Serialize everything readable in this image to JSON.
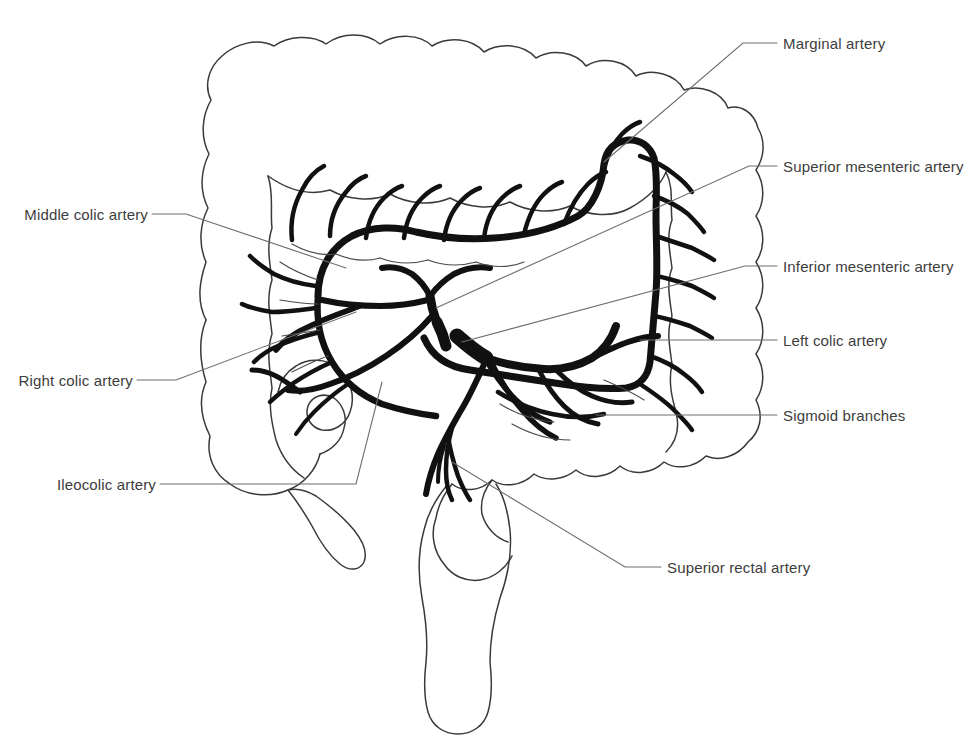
{
  "figure": {
    "background_color": "#ffffff",
    "outline_color": "#3a3a3a",
    "artery_color": "#111111",
    "leader_color": "#6e6e6e",
    "text_color": "#3d3d3d"
  },
  "labels": {
    "marginal_artery": "Marginal artery",
    "superior_mesenteric_artery": "Superior mesenteric artery",
    "inferior_mesenteric_artery": "Inferior mesenteric artery",
    "left_colic_artery": "Left colic artery",
    "sigmoid_branches": "Sigmoid branches",
    "superior_rectal_artery": "Superior rectal artery",
    "middle_colic_artery": "Middle colic artery",
    "right_colic_artery": "Right colic artery",
    "ileocolic_artery": "Ileocolic artery"
  },
  "label_positions": {
    "marginal_artery": {
      "x": 783,
      "y": 38,
      "side": "right"
    },
    "superior_mesenteric_artery": {
      "x": 783,
      "y": 160,
      "side": "right"
    },
    "inferior_mesenteric_artery": {
      "x": 783,
      "y": 261,
      "side": "right"
    },
    "left_colic_artery": {
      "x": 783,
      "y": 334,
      "side": "right"
    },
    "sigmoid_branches": {
      "x": 783,
      "y": 409,
      "side": "right"
    },
    "superior_rectal_artery": {
      "x": 667,
      "y": 562,
      "side": "right"
    },
    "middle_colic_artery": {
      "x": 18,
      "y": 208,
      "side": "left"
    },
    "right_colic_artery": {
      "x": 18,
      "y": 374,
      "side": "left"
    },
    "ileocolic_artery": {
      "x": 55,
      "y": 478,
      "side": "left"
    }
  },
  "structures": [
    "ascending colon",
    "transverse colon",
    "descending colon",
    "sigmoid colon",
    "cecum",
    "appendix",
    "rectum",
    "ileum"
  ],
  "arteries": [
    "marginal artery",
    "superior mesenteric artery",
    "inferior mesenteric artery",
    "middle colic artery",
    "right colic artery",
    "left colic artery",
    "ileocolic artery",
    "sigmoid branches",
    "superior rectal artery",
    "vasa recta"
  ]
}
